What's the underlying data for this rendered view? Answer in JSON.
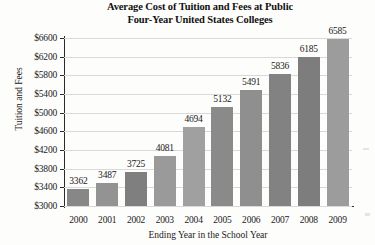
{
  "chart_data": {
    "type": "bar",
    "title": "Average Cost of Tuition and Fees at Public Four-Year United States Colleges",
    "title_lines": [
      "Average Cost of Tuition and Fees at Public",
      "Four-Year United States Colleges"
    ],
    "xlabel": "Ending Year in the School Year",
    "ylabel": "Tuition and Fees",
    "categories": [
      "2000",
      "2001",
      "2002",
      "2003",
      "2004",
      "2005",
      "2006",
      "2007",
      "2008",
      "2009"
    ],
    "values": [
      3362,
      3487,
      3725,
      4081,
      4694,
      5132,
      5491,
      5836,
      6185,
      6585
    ],
    "value_labels": [
      "3362",
      "3487",
      "3725",
      "4081",
      "4694",
      "5132",
      "5491",
      "5836",
      "6185",
      "6585"
    ],
    "ylim": [
      3000,
      6600
    ],
    "ytick_values": [
      3000,
      3400,
      3800,
      4200,
      4600,
      5000,
      5400,
      5800,
      6200,
      6600
    ],
    "ytick_labels": [
      "$3000",
      "$3400",
      "$3800",
      "$4200",
      "$4600",
      "$5000",
      "$5400",
      "$5800",
      "$6200",
      "$6600"
    ],
    "ytick_step": 400,
    "grid": true,
    "grid_axis": "y",
    "legend": false,
    "bar_color": "#8d8d8d",
    "grid_color": "#d9d9d9",
    "axis_color": "#2b2b2b",
    "background_color": "#fdfdfc",
    "text_color": "#1a1a1a"
  }
}
